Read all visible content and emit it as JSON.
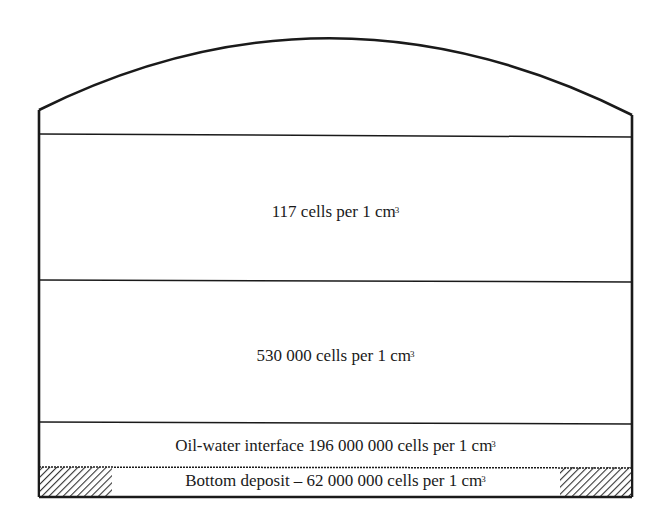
{
  "diagram": {
    "type": "storage-tank-cross-section",
    "layers": [
      {
        "id": "upper-fuel",
        "text": "117 cells per 1 cm",
        "unit_sup": "3"
      },
      {
        "id": "lower-fuel",
        "text": "530 000 cells per 1 cm",
        "unit_sup": "3"
      },
      {
        "id": "oil-water-interface",
        "text": "Oil-water interface 196 000 000 cells per 1 cm",
        "unit_sup": "3"
      },
      {
        "id": "bottom-deposit",
        "text": "Bottom deposit – 62 000 000 cells per 1 cm",
        "unit_sup": "3"
      }
    ],
    "colors": {
      "stroke": "#1a1a1a",
      "background": "#ffffff",
      "hatch": "#333333"
    }
  }
}
